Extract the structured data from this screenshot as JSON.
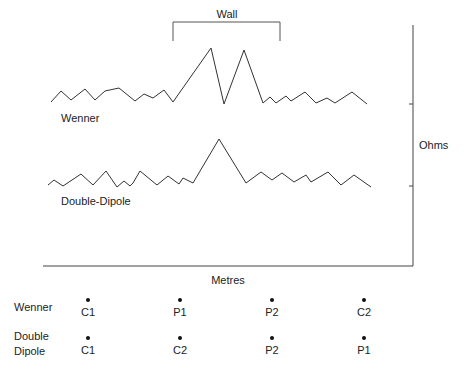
{
  "diagram": {
    "wall_label": "Wall",
    "y_axis_label": "Ohms",
    "x_axis_label": "Metres",
    "series": [
      {
        "name": "Wenner",
        "label": "Wenner",
        "points": [
          [
            51,
            102
          ],
          [
            61,
            91
          ],
          [
            71,
            100
          ],
          [
            85,
            89
          ],
          [
            95,
            100
          ],
          [
            105,
            91
          ],
          [
            119,
            88
          ],
          [
            135,
            101
          ],
          [
            144,
            94
          ],
          [
            153,
            98
          ],
          [
            164,
            90
          ],
          [
            173,
            102
          ],
          [
            211,
            48
          ],
          [
            224,
            104
          ],
          [
            244,
            50
          ],
          [
            263,
            103
          ],
          [
            270,
            97
          ],
          [
            276,
            103
          ],
          [
            286,
            96
          ],
          [
            291,
            101
          ],
          [
            305,
            92
          ],
          [
            316,
            103
          ],
          [
            327,
            98
          ],
          [
            335,
            103
          ],
          [
            352,
            92
          ],
          [
            367,
            104
          ]
        ]
      },
      {
        "name": "Double-Dipole",
        "label": "Double-Dipole",
        "points": [
          [
            48,
            185
          ],
          [
            54,
            180
          ],
          [
            63,
            186
          ],
          [
            81,
            174
          ],
          [
            93,
            185
          ],
          [
            106,
            171
          ],
          [
            117,
            187
          ],
          [
            124,
            181
          ],
          [
            130,
            186
          ],
          [
            133,
            183
          ],
          [
            140,
            171
          ],
          [
            157,
            185
          ],
          [
            168,
            176
          ],
          [
            179,
            184
          ],
          [
            183,
            178
          ],
          [
            193,
            183
          ],
          [
            219,
            139
          ],
          [
            246,
            183
          ],
          [
            261,
            172
          ],
          [
            272,
            180
          ],
          [
            282,
            173
          ],
          [
            294,
            182
          ],
          [
            306,
            175
          ],
          [
            311,
            182
          ],
          [
            328,
            172
          ],
          [
            341,
            185
          ],
          [
            354,
            175
          ],
          [
            371,
            187
          ]
        ]
      }
    ],
    "electrode_arrays": [
      {
        "name": "Wenner",
        "label_lines": [
          "Wenner"
        ],
        "electrodes": [
          "C1",
          "P1",
          "P2",
          "C2"
        ]
      },
      {
        "name": "Double Dipole",
        "label_lines": [
          "Double",
          "Dipole"
        ],
        "electrodes": [
          "C1",
          "C2",
          "P2",
          "P1"
        ]
      }
    ],
    "electrode_x_positions": [
      88,
      180,
      272,
      364
    ]
  }
}
